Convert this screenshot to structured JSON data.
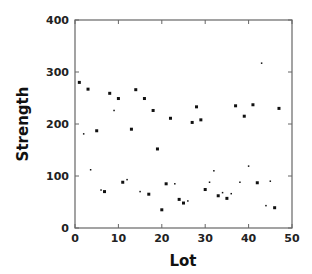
{
  "chart_data": {
    "type": "scatter",
    "title": "",
    "xlabel": "Lot",
    "ylabel": "Strength",
    "xlim": [
      0,
      50
    ],
    "ylim": [
      0,
      400
    ],
    "xticks": [
      0,
      10,
      20,
      30,
      40,
      50
    ],
    "yticks": [
      0,
      100,
      200,
      300,
      400
    ],
    "grid": false,
    "legend": null,
    "marker_color": "#111111",
    "series": [
      {
        "name": "Strength",
        "x": [
          1,
          2,
          3,
          3.6,
          5,
          6,
          6.8,
          8,
          9,
          10,
          11,
          12,
          13,
          14,
          15,
          16,
          17,
          18,
          19,
          20,
          21,
          22,
          23,
          24,
          25,
          26,
          27,
          28,
          29,
          30,
          31,
          32,
          33,
          34,
          35,
          36,
          37,
          38,
          39,
          40,
          41,
          42,
          43,
          44,
          45,
          46,
          47
        ],
        "y": [
          280,
          181,
          267,
          112,
          187,
          73,
          70,
          259,
          226,
          249,
          88,
          93,
          190,
          266,
          70,
          249,
          65,
          226,
          152,
          35,
          85,
          211,
          85,
          55,
          48,
          52,
          203,
          233,
          208,
          74,
          88,
          110,
          62,
          68,
          57,
          66,
          235,
          88,
          215,
          119,
          237,
          87,
          317,
          43,
          90,
          39,
          230
        ],
        "marker_size": [
          3,
          1.5,
          3,
          1.5,
          3,
          1.5,
          3,
          3,
          1.5,
          3,
          3,
          1.5,
          3,
          3,
          1.5,
          3,
          3,
          3,
          3,
          3,
          3,
          3,
          1.5,
          3,
          3,
          1.5,
          3,
          3,
          3,
          3,
          1.5,
          1.5,
          3,
          1.5,
          3,
          1.5,
          3,
          1.5,
          3,
          1.5,
          3,
          3,
          1.5,
          1.5,
          1.5,
          3,
          3
        ]
      }
    ]
  }
}
